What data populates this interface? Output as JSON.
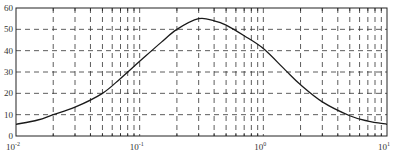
{
  "chart_data": {
    "type": "line",
    "title": "",
    "xlabel": "",
    "ylabel": "",
    "xscale": "log",
    "xlim": [
      0.01,
      10
    ],
    "ylim": [
      0,
      60
    ],
    "grid": true,
    "grid_style": "dashed",
    "x_ticks": [
      {
        "value": 0.01,
        "base": "10",
        "exp": "-2"
      },
      {
        "value": 0.1,
        "base": "10",
        "exp": "-1"
      },
      {
        "value": 1,
        "base": "10",
        "exp": "0"
      },
      {
        "value": 10,
        "base": "10",
        "exp": "1"
      }
    ],
    "y_ticks": [
      "0",
      "10",
      "20",
      "30",
      "40",
      "50",
      "60"
    ],
    "series": [
      {
        "name": "curve",
        "color": "#1a1a1a",
        "x": [
          0.01,
          0.015,
          0.02,
          0.03,
          0.05,
          0.07,
          0.1,
          0.15,
          0.2,
          0.3,
          0.4,
          0.5,
          0.7,
          1,
          1.5,
          2,
          3,
          5,
          7,
          10
        ],
        "y": [
          5.5,
          7.5,
          10,
          13.5,
          20,
          27,
          35,
          44,
          50,
          55,
          54,
          52,
          47,
          41,
          31,
          24,
          16,
          9.5,
          7,
          5.5
        ]
      }
    ]
  }
}
